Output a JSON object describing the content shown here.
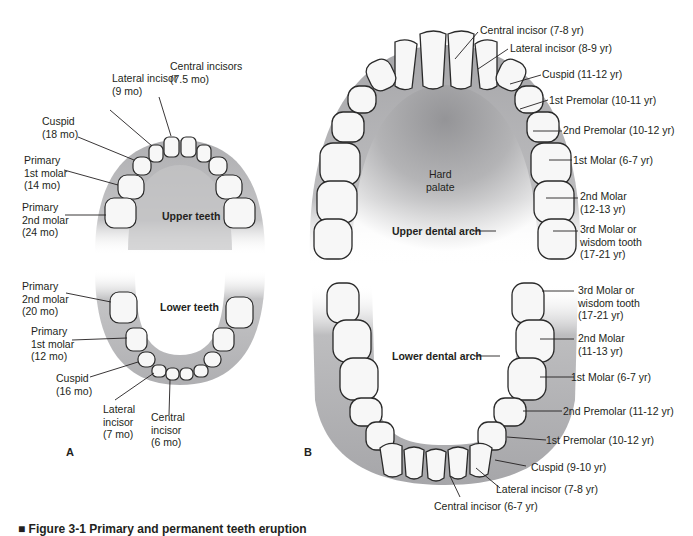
{
  "figure": {
    "caption": "■ Figure 3-1 Primary and permanent teeth eruption",
    "panel_a": {
      "letter": "A",
      "upper": {
        "title": "Upper teeth",
        "labels": [
          {
            "name": "Central incisors",
            "age": "(7.5 mo)"
          },
          {
            "name": "Lateral incisor",
            "age": "(9 mo)"
          },
          {
            "name": "Cuspid",
            "age": "(18 mo)"
          },
          {
            "name": "Primary 1st molar",
            "age": "(14 mo)"
          },
          {
            "name": "Primary 2nd molar",
            "age": "(24 mo)"
          }
        ]
      },
      "lower": {
        "title": "Lower teeth",
        "labels": [
          {
            "name": "Primary 2nd molar",
            "age": "(20 mo)"
          },
          {
            "name": "Primary 1st molar",
            "age": "(12 mo)"
          },
          {
            "name": "Cuspid",
            "age": "(16 mo)"
          },
          {
            "name": "Lateral incisor",
            "age": "(7 mo)"
          },
          {
            "name": "Central incisor",
            "age": "(6 mo)"
          }
        ]
      }
    },
    "panel_b": {
      "letter": "B",
      "upper": {
        "title": "Upper dental arch",
        "palate": "Hard\npalate",
        "labels": [
          "Central incisor (7-8 yr)",
          "Lateral incisor (8-9 yr)",
          "Cuspid (11-12 yr)",
          "1st Premolar (10-11 yr)",
          "2nd Premolar (10-12 yr)",
          "1st Molar (6-7 yr)",
          "2nd Molar\n(12-13 yr)",
          "3rd Molar or\nwisdom tooth\n(17-21 yr)"
        ]
      },
      "lower": {
        "title": "Lower dental arch",
        "labels": [
          "3rd Molar or\nwisdom tooth\n(17-21 yr)",
          "2nd Molar\n(11-13 yr)",
          "1st Molar (6-7 yr)",
          "2nd Premolar (11-12 yr)",
          "1st Premolar (10-12 yr)",
          "Cuspid (9-10 yr)",
          "Lateral incisor (7-8 yr)",
          "Central incisor (6-7 yr)"
        ]
      }
    },
    "colors": {
      "gum": "#a9a9ab",
      "gum_dark": "#8e8e91",
      "tooth_fill": "#f7f7f7",
      "tooth_stroke": "#2a2a2a",
      "text": "#231f20"
    }
  }
}
